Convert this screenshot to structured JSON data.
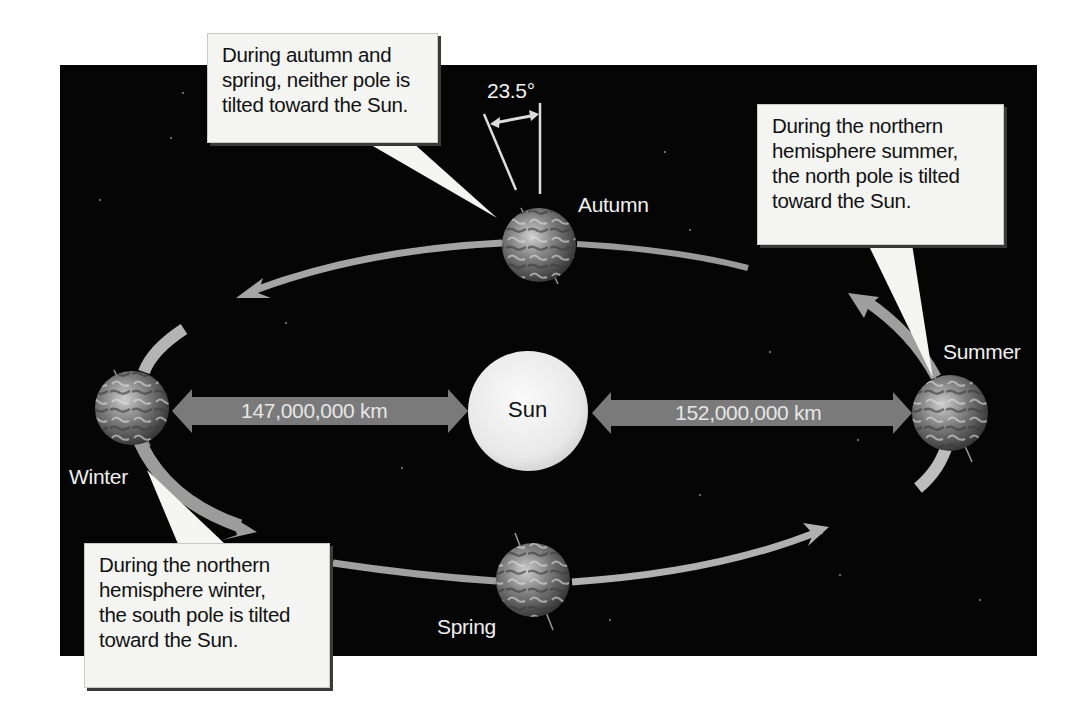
{
  "diagram": {
    "type": "earth-orbit-seasons",
    "colors": {
      "background": "#ffffff",
      "space": "#050505",
      "orbit_arrow": "#a9a9a9",
      "distance_arrow": "#7a7a7a",
      "sun": "#ececec",
      "callout_fill": "#f4f4f2",
      "label_text": "#f0f0f0"
    },
    "center": {
      "label": "Sun"
    },
    "positions": [
      {
        "id": "autumn",
        "label": "Autumn"
      },
      {
        "id": "summer",
        "label": "Summer"
      },
      {
        "id": "winter",
        "label": "Winter"
      },
      {
        "id": "spring",
        "label": "Spring"
      }
    ],
    "distances": {
      "perihelion": "147,000,000 km",
      "aphelion": "152,000,000 km"
    },
    "tilt_angle": "23.5°",
    "callouts": {
      "equinox": {
        "lines": [
          "During autumn and",
          "spring, neither pole is",
          "tilted toward the Sun."
        ]
      },
      "summer": {
        "lines": [
          "During the northern",
          "hemisphere summer,",
          "the north pole is tilted",
          "toward the Sun."
        ]
      },
      "winter": {
        "lines": [
          "During the northern",
          "hemisphere winter,",
          "the south pole is tilted",
          "toward the Sun."
        ]
      }
    }
  }
}
